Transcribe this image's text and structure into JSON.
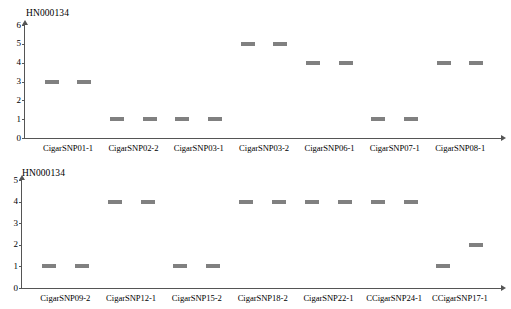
{
  "figure": {
    "background": "#ffffff",
    "marker_color": "#808080",
    "axis_color": "#555555"
  },
  "chart_data": [
    {
      "type": "scatter",
      "title": "HN000134",
      "xlabel": "",
      "ylabel": "",
      "ylim": [
        0,
        6
      ],
      "yticks": [
        0,
        1,
        2,
        3,
        4,
        5,
        6
      ],
      "grid": false,
      "legend": "none",
      "marker_style": "horizontal-dash",
      "categories": [
        "CigarSNP01-1",
        "CigarSNP02-2",
        "CigarSNP03-1",
        "CigarSNP03-2",
        "CigarSNP06-1",
        "CigarSNP07-1",
        "CigarSNP08-1"
      ],
      "points": [
        {
          "x": 1,
          "y": 3,
          "category": "CigarSNP01-1"
        },
        {
          "x": 2,
          "y": 3,
          "category": "CigarSNP01-1"
        },
        {
          "x": 3,
          "y": 1,
          "category": "CigarSNP02-2"
        },
        {
          "x": 4,
          "y": 1,
          "category": "CigarSNP02-2"
        },
        {
          "x": 5,
          "y": 1,
          "category": "CigarSNP03-1"
        },
        {
          "x": 6,
          "y": 1,
          "category": "CigarSNP03-1"
        },
        {
          "x": 7,
          "y": 5,
          "category": "CigarSNP03-2"
        },
        {
          "x": 8,
          "y": 5,
          "category": "CigarSNP03-2"
        },
        {
          "x": 9,
          "y": 4,
          "category": "CigarSNP06-1"
        },
        {
          "x": 10,
          "y": 4,
          "category": "CigarSNP06-1"
        },
        {
          "x": 11,
          "y": 1,
          "category": "CigarSNP07-1"
        },
        {
          "x": 12,
          "y": 1,
          "category": "CigarSNP07-1"
        },
        {
          "x": 13,
          "y": 4,
          "category": "CigarSNP08-1"
        },
        {
          "x": 14,
          "y": 4,
          "category": "CigarSNP08-1"
        }
      ],
      "values": [
        3,
        3,
        1,
        1,
        1,
        1,
        5,
        5,
        4,
        4,
        1,
        1,
        4,
        4
      ]
    },
    {
      "type": "scatter",
      "title": "HN000134",
      "xlabel": "",
      "ylabel": "",
      "ylim": [
        0,
        5
      ],
      "yticks": [
        0,
        1,
        2,
        3,
        4,
        5
      ],
      "grid": false,
      "legend": "none",
      "marker_style": "horizontal-dash",
      "categories": [
        "CigarSNP09-2",
        "CigarSNP12-1",
        "CigarSNP15-2",
        "CigarSNP18-2",
        "CigarSNP22-1",
        "CCigarSNP24-1",
        "CCigarSNP17-1"
      ],
      "points": [
        {
          "x": 1,
          "y": 1,
          "category": "CigarSNP09-2"
        },
        {
          "x": 2,
          "y": 1,
          "category": "CigarSNP09-2"
        },
        {
          "x": 3,
          "y": 4,
          "category": "CigarSNP12-1"
        },
        {
          "x": 4,
          "y": 4,
          "category": "CigarSNP12-1"
        },
        {
          "x": 5,
          "y": 1,
          "category": "CigarSNP15-2"
        },
        {
          "x": 6,
          "y": 1,
          "category": "CigarSNP15-2"
        },
        {
          "x": 7,
          "y": 4,
          "category": "CigarSNP18-2"
        },
        {
          "x": 8,
          "y": 4,
          "category": "CigarSNP18-2"
        },
        {
          "x": 9,
          "y": 4,
          "category": "CigarSNP22-1"
        },
        {
          "x": 10,
          "y": 4,
          "category": "CigarSNP22-1"
        },
        {
          "x": 11,
          "y": 4,
          "category": "CCigarSNP24-1"
        },
        {
          "x": 12,
          "y": 4,
          "category": "CCigarSNP24-1"
        },
        {
          "x": 13,
          "y": 1,
          "category": "CCigarSNP17-1"
        },
        {
          "x": 14,
          "y": 2,
          "category": "CCigarSNP17-1"
        }
      ],
      "values": [
        1,
        1,
        4,
        4,
        1,
        1,
        4,
        4,
        4,
        4,
        4,
        4,
        1,
        2
      ]
    }
  ]
}
